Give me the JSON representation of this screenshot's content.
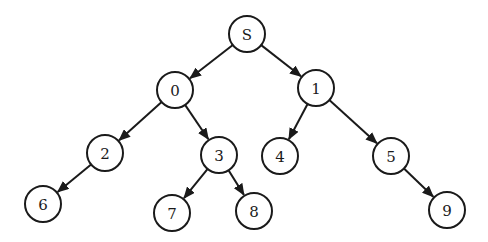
{
  "diagram": {
    "type": "tree",
    "node_radius": 18,
    "stroke_color": "#1a1a1a",
    "background": "#ffffff",
    "nodes": [
      {
        "id": "S",
        "label": "S",
        "x": 247,
        "y": 34
      },
      {
        "id": "0",
        "label": "0",
        "x": 175,
        "y": 90
      },
      {
        "id": "1",
        "label": "1",
        "x": 316,
        "y": 88
      },
      {
        "id": "2",
        "label": "2",
        "x": 105,
        "y": 153
      },
      {
        "id": "3",
        "label": "3",
        "x": 219,
        "y": 155
      },
      {
        "id": "4",
        "label": "4",
        "x": 280,
        "y": 156
      },
      {
        "id": "5",
        "label": "5",
        "x": 391,
        "y": 156
      },
      {
        "id": "6",
        "label": "6",
        "x": 43,
        "y": 204
      },
      {
        "id": "7",
        "label": "7",
        "x": 172,
        "y": 213
      },
      {
        "id": "8",
        "label": "8",
        "x": 254,
        "y": 211
      },
      {
        "id": "9",
        "label": "9",
        "x": 447,
        "y": 210
      }
    ],
    "edges": [
      {
        "from": "S",
        "to": "0"
      },
      {
        "from": "S",
        "to": "1"
      },
      {
        "from": "0",
        "to": "2"
      },
      {
        "from": "0",
        "to": "3"
      },
      {
        "from": "1",
        "to": "4"
      },
      {
        "from": "1",
        "to": "5"
      },
      {
        "from": "2",
        "to": "6"
      },
      {
        "from": "3",
        "to": "7"
      },
      {
        "from": "3",
        "to": "8"
      },
      {
        "from": "5",
        "to": "9"
      }
    ]
  }
}
